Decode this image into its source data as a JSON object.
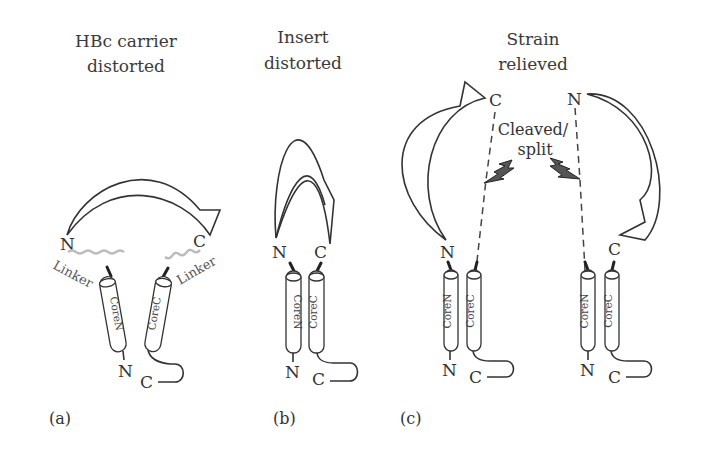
{
  "panels": {
    "a": {
      "label": "(a)",
      "title_line1": "HBc carrier",
      "title_line2": "distorted",
      "insert_n": "N",
      "insert_c": "C",
      "linker_left": "Linker",
      "linker_right": "Linker",
      "core_n": "CoreN",
      "core_c": "CoreC",
      "bottom_n": "N",
      "bottom_c": "C"
    },
    "b": {
      "label": "(b)",
      "title_line1": "Insert",
      "title_line2": "distorted",
      "insert_n": "N",
      "insert_c": "C",
      "core_n": "CoreN",
      "core_c": "CoreC",
      "bottom_n": "N",
      "bottom_c": "C"
    },
    "c": {
      "label": "(c)",
      "title_line1": "Strain",
      "title_line2": "relieved",
      "cleave_line1": "Cleaved/",
      "cleave_line2": "split",
      "top_c": "C",
      "top_n": "N",
      "left_n": "N",
      "right_c": "C",
      "left_core_n": "CoreN",
      "left_core_c": "CoreC",
      "right_core_n": "CoreN",
      "right_core_c": "CoreC",
      "left_bottom_n": "N",
      "left_bottom_c": "C",
      "right_bottom_n": "N",
      "right_bottom_c": "C"
    }
  }
}
